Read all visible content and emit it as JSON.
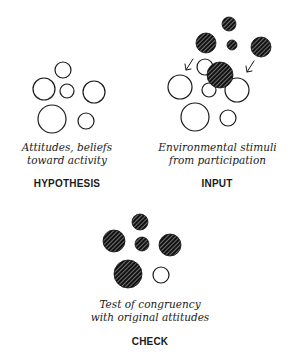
{
  "panels": {
    "hypothesis": {
      "caption_line1": "Attitudes, beliefs",
      "caption_line2": "toward activity",
      "label": "HYPOTHESIS"
    },
    "input": {
      "caption_line1": "Environmental stimuli",
      "caption_line2": "from participation",
      "label": "INPUT"
    },
    "check": {
      "caption_line1": "Test of congruency",
      "caption_line2": "with original attitudes",
      "label": "CHECK"
    }
  },
  "colors": {
    "stroke": "#1a1a1a",
    "hatched_fill": "#1a1a1a",
    "background": "#ffffff"
  }
}
